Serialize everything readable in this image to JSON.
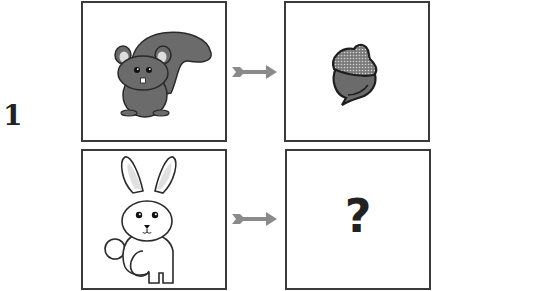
{
  "puzzle": {
    "number": "1",
    "rows": [
      {
        "source": {
          "subject": "squirrel",
          "icon": "squirrel-icon"
        },
        "relation": {
          "icon": "arrow-right-icon"
        },
        "target": {
          "subject": "acorn",
          "icon": "acorn-icon"
        }
      },
      {
        "source": {
          "subject": "rabbit",
          "icon": "rabbit-icon"
        },
        "relation": {
          "icon": "arrow-right-icon"
        },
        "target": {
          "subject": "unknown",
          "text": "?"
        }
      }
    ]
  },
  "colors": {
    "outline": "#3a3a3a",
    "fill_dark": "#6b6b6b",
    "fill_light": "#d8d8d8",
    "arrow": "#8a8a8a"
  }
}
